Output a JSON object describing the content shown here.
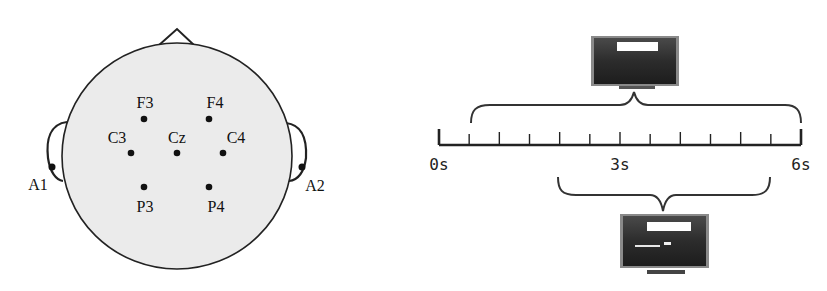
{
  "figure": {
    "left_panel": {
      "title": "EEG electrode placement (10-20 system)",
      "head": {
        "cx": 177,
        "cy": 156,
        "rx": 115,
        "ry": 113,
        "fill": "#ebebeb",
        "stroke": "#222222"
      },
      "nose": {
        "apex": [
          177,
          29
        ],
        "left": [
          158,
          46
        ],
        "right": [
          195,
          46
        ]
      },
      "electrodes": [
        {
          "label": "F3",
          "x": 144,
          "y": 119,
          "lx": 145,
          "ly": 108
        },
        {
          "label": "F4",
          "x": 209,
          "y": 119,
          "lx": 215,
          "ly": 108
        },
        {
          "label": "C3",
          "x": 131,
          "y": 153,
          "lx": 117,
          "ly": 143
        },
        {
          "label": "Cz",
          "x": 177,
          "y": 153,
          "lx": 177,
          "ly": 143
        },
        {
          "label": "C4",
          "x": 223,
          "y": 153,
          "lx": 236,
          "ly": 143
        },
        {
          "label": "P3",
          "x": 144,
          "y": 187,
          "lx": 145,
          "ly": 212
        },
        {
          "label": "P4",
          "x": 209,
          "y": 187,
          "lx": 216,
          "ly": 212
        }
      ],
      "reference_electrodes": [
        {
          "label": "A1",
          "x": 52,
          "y": 167,
          "lx": 38,
          "ly": 190
        },
        {
          "label": "A2",
          "x": 302,
          "y": 167,
          "lx": 315,
          "ly": 191
        }
      ]
    },
    "right_panel": {
      "timeline": {
        "x_start": 439,
        "x_end": 801,
        "y": 145,
        "duration_s": 6,
        "tick_step_s": 0.5,
        "labels": [
          {
            "text": "0s",
            "t": 0
          },
          {
            "text": "3s",
            "t": 3
          },
          {
            "text": "6s",
            "t": 6
          }
        ]
      },
      "top_brace": {
        "from_s": 0.5,
        "to_s": 6,
        "label": "cue display"
      },
      "bottom_brace": {
        "from_s": 2,
        "to_s": 5.5,
        "label": "task display"
      },
      "monitors": [
        {
          "name": "cue-monitor",
          "x": 591,
          "y": 36,
          "w": 88,
          "h": 50
        },
        {
          "name": "task-monitor",
          "x": 620,
          "y": 214,
          "w": 89,
          "h": 54
        }
      ]
    }
  }
}
